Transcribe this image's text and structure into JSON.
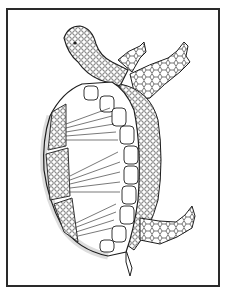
{
  "image": {
    "subject": "Turtle coloring page",
    "description": "Black-and-white line-art zentangle-style turtle viewed from the side, head at upper left, limbs at right, shell with fan-shaped ray patterns",
    "frame": {
      "border_color": "#2a2a2a",
      "background": "#ffffff"
    },
    "colors": {
      "ink": "#1e1e1e",
      "paper": "#ffffff"
    }
  }
}
